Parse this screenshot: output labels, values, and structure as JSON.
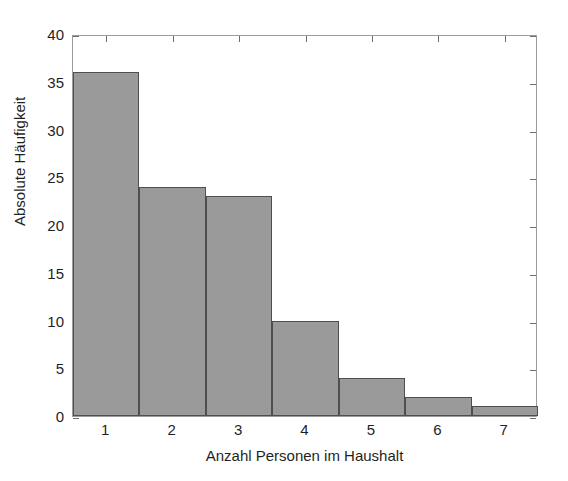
{
  "chart_data": {
    "type": "bar",
    "title": "",
    "subtitle": "",
    "xlabel": "Anzahl Personen im Haushalt",
    "ylabel": "Absolute Häufigkeit",
    "categories": [
      "1",
      "2",
      "3",
      "4",
      "5",
      "6",
      "7"
    ],
    "values": [
      36,
      24,
      23,
      10,
      4,
      2,
      1
    ],
    "series": [
      {
        "name": "Absolute Häufigkeit",
        "values": [
          36,
          24,
          23,
          10,
          4,
          2,
          1
        ]
      }
    ],
    "xlim": [
      0.5,
      7.5
    ],
    "ylim": [
      0,
      40
    ],
    "xticks": [
      1,
      2,
      3,
      4,
      5,
      6,
      7
    ],
    "yticks": [
      0,
      5,
      10,
      15,
      20,
      25,
      30,
      35,
      40
    ],
    "ytick_labels": [
      "0",
      "5",
      "10",
      "15",
      "20",
      "25",
      "30",
      "35",
      "40"
    ],
    "xtick_labels": [
      "1",
      "2",
      "3",
      "4",
      "5",
      "6",
      "7"
    ],
    "grid": false,
    "legend": false,
    "legend_position": "none",
    "bar_width": 1,
    "colors": {
      "bar_fill": "#9a9a9a",
      "bar_edge": "#4f4f4f",
      "axis": "#9b9b9b",
      "tick": "#6f6f6f",
      "text": "#1f1f1f",
      "background": "#ffffff"
    }
  }
}
